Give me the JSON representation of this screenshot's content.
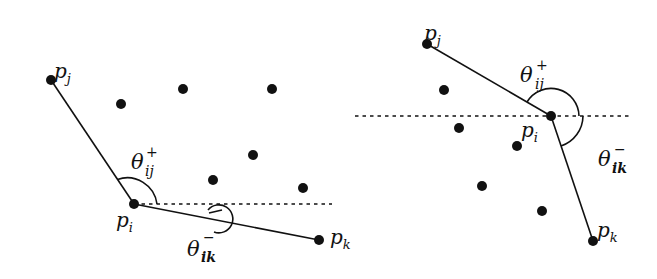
{
  "figure": {
    "background": "#ffffff",
    "ink": "#111111",
    "panels": [
      {
        "id": "left",
        "points": {
          "p_i": {
            "x": 134,
            "y": 204,
            "label": "p",
            "sub": "i"
          },
          "p_j": {
            "x": 51,
            "y": 80,
            "label": "p",
            "sub": "j"
          },
          "p_k": {
            "x": 319,
            "y": 240,
            "label": "p",
            "sub": "k"
          }
        },
        "other_points": [
          {
            "x": 121,
            "y": 104
          },
          {
            "x": 183,
            "y": 89
          },
          {
            "x": 272,
            "y": 89
          },
          {
            "x": 253,
            "y": 155
          },
          {
            "x": 213,
            "y": 180
          },
          {
            "x": 303,
            "y": 188
          }
        ],
        "reference_line": {
          "x1": 134,
          "x2": 332,
          "y": 204,
          "style": "dotted"
        },
        "angles": {
          "theta_plus": {
            "symbol": "θ",
            "sup": "+",
            "sub": "ij"
          },
          "theta_minus": {
            "symbol": "θ",
            "sup": "−",
            "sub": "ik"
          }
        }
      },
      {
        "id": "right",
        "points": {
          "p_i": {
            "x": 551,
            "y": 116,
            "label": "p",
            "sub": "i"
          },
          "p_j": {
            "x": 427,
            "y": 44,
            "label": "p",
            "sub": "j"
          },
          "p_k": {
            "x": 593,
            "y": 241,
            "label": "p",
            "sub": "k"
          }
        },
        "other_points": [
          {
            "x": 444,
            "y": 90
          },
          {
            "x": 459,
            "y": 128
          },
          {
            "x": 517,
            "y": 146
          },
          {
            "x": 482,
            "y": 186
          },
          {
            "x": 542,
            "y": 211
          }
        ],
        "reference_line": {
          "x1": 355,
          "x2": 632,
          "y": 116,
          "style": "dotted"
        },
        "angles": {
          "theta_plus": {
            "symbol": "θ",
            "sup": "+",
            "sub": "ij"
          },
          "theta_minus": {
            "symbol": "θ",
            "sup": "−",
            "sub": "ik"
          }
        }
      }
    ]
  }
}
